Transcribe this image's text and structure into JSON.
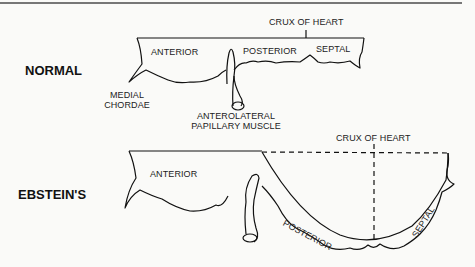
{
  "diagram": {
    "panels": [
      {
        "title": "NORMAL",
        "labels": {
          "crux": "CRUX OF HEART",
          "anterior": "ANTERIOR",
          "posterior": "POSTERIOR",
          "septal": "SEPTAL",
          "medial_chordae_1": "MEDIAL",
          "medial_chordae_2": "CHORDAE",
          "papillary_1": "ANTEROLATERAL",
          "papillary_2": "PAPILLARY MUSCLE"
        }
      },
      {
        "title": "EBSTEIN'S",
        "labels": {
          "crux": "CRUX OF HEART",
          "anterior": "ANTERIOR",
          "posterior": "POSTERIOR",
          "septal": "SEPTAL"
        }
      }
    ]
  }
}
